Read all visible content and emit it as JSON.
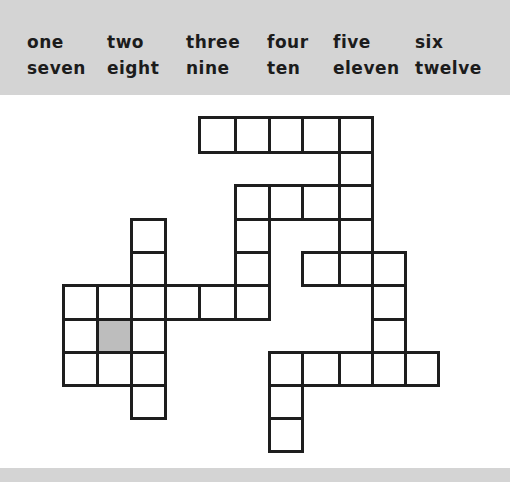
{
  "word_bank": {
    "rows": [
      [
        "one",
        "two",
        "three",
        "four",
        "five",
        "six"
      ],
      [
        "seven",
        "eight",
        "nine",
        "ten",
        "eleven",
        "twelve"
      ]
    ]
  },
  "colors": {
    "header_bg": "#d4d4d4",
    "cell_border": "#1e1e1e",
    "shaded_cell": "#bdbdbd"
  },
  "puzzle": {
    "type": "fill-in crossword grid",
    "col_edges": [
      63,
      97,
      131,
      165,
      199,
      235,
      269,
      302,
      339,
      372,
      405,
      438
    ],
    "row_edges": [
      117,
      152,
      185,
      219,
      252,
      285,
      319,
      352,
      385,
      418,
      451
    ],
    "cells": [
      {
        "r": 0,
        "c": 4
      },
      {
        "r": 0,
        "c": 5
      },
      {
        "r": 0,
        "c": 6
      },
      {
        "r": 0,
        "c": 7
      },
      {
        "r": 0,
        "c": 8
      },
      {
        "r": 1,
        "c": 8
      },
      {
        "r": 2,
        "c": 5
      },
      {
        "r": 2,
        "c": 6
      },
      {
        "r": 2,
        "c": 7
      },
      {
        "r": 2,
        "c": 8
      },
      {
        "r": 3,
        "c": 2
      },
      {
        "r": 3,
        "c": 5
      },
      {
        "r": 3,
        "c": 8
      },
      {
        "r": 4,
        "c": 2
      },
      {
        "r": 4,
        "c": 5
      },
      {
        "r": 4,
        "c": 7
      },
      {
        "r": 4,
        "c": 8
      },
      {
        "r": 4,
        "c": 9
      },
      {
        "r": 5,
        "c": 0
      },
      {
        "r": 5,
        "c": 1
      },
      {
        "r": 5,
        "c": 2
      },
      {
        "r": 5,
        "c": 3
      },
      {
        "r": 5,
        "c": 4
      },
      {
        "r": 5,
        "c": 5
      },
      {
        "r": 5,
        "c": 9
      },
      {
        "r": 6,
        "c": 0
      },
      {
        "r": 6,
        "c": 1,
        "shaded": true
      },
      {
        "r": 6,
        "c": 2
      },
      {
        "r": 6,
        "c": 9
      },
      {
        "r": 7,
        "c": 0
      },
      {
        "r": 7,
        "c": 1
      },
      {
        "r": 7,
        "c": 2
      },
      {
        "r": 7,
        "c": 6
      },
      {
        "r": 7,
        "c": 7
      },
      {
        "r": 7,
        "c": 8
      },
      {
        "r": 7,
        "c": 9
      },
      {
        "r": 7,
        "c": 10
      },
      {
        "r": 8,
        "c": 2
      },
      {
        "r": 8,
        "c": 6
      },
      {
        "r": 9,
        "c": 6
      }
    ]
  }
}
